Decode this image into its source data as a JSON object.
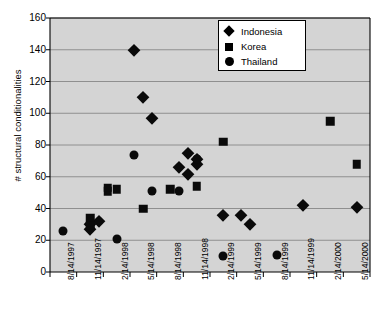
{
  "chart_data": {
    "type": "scatter",
    "title": "",
    "xlabel": "",
    "ylabel": "# structural conditionalities",
    "ylim": [
      0,
      160
    ],
    "yticks": [
      0,
      20,
      40,
      60,
      80,
      100,
      120,
      140,
      160
    ],
    "grid": true,
    "legend_position": "top-right",
    "plot_background": "#d4d4d4",
    "marker_color": "#000000",
    "x_categories": [
      "8/14/1997",
      "11/14/1997",
      "2/14/1998",
      "5/14/1998",
      "8/14/1998",
      "11/14/1998",
      "2/14/1999",
      "5/14/1999",
      "8/14/1999",
      "11/14/1999",
      "2/14/2000",
      "5/14/2000"
    ],
    "series": [
      {
        "name": "Indonesia",
        "marker": "diamond",
        "points": [
          {
            "x": "11/14/1997",
            "y": 30
          },
          {
            "x": "11/14/1997",
            "y": 27
          },
          {
            "x": "12/14/1997",
            "y": 32
          },
          {
            "x": "4/14/1998",
            "y": 140
          },
          {
            "x": "5/14/1998",
            "y": 110
          },
          {
            "x": "6/14/1998",
            "y": 97
          },
          {
            "x": "9/14/1998",
            "y": 66
          },
          {
            "x": "10/14/1998",
            "y": 62
          },
          {
            "x": "10/14/1998",
            "y": 75
          },
          {
            "x": "11/14/1998",
            "y": 71
          },
          {
            "x": "11/14/1998",
            "y": 68
          },
          {
            "x": "2/14/1999",
            "y": 36
          },
          {
            "x": "4/14/1999",
            "y": 36
          },
          {
            "x": "5/14/1999",
            "y": 30
          },
          {
            "x": "11/14/1999",
            "y": 42
          },
          {
            "x": "5/14/2000",
            "y": 41
          }
        ]
      },
      {
        "name": "Korea",
        "marker": "square",
        "points": [
          {
            "x": "11/14/1997",
            "y": 34
          },
          {
            "x": "11/14/1997",
            "y": 29
          },
          {
            "x": "1/14/1998",
            "y": 51
          },
          {
            "x": "1/14/1998",
            "y": 53
          },
          {
            "x": "2/14/1998",
            "y": 52
          },
          {
            "x": "5/14/1998",
            "y": 40
          },
          {
            "x": "8/14/1998",
            "y": 52
          },
          {
            "x": "11/14/1998",
            "y": 54
          },
          {
            "x": "2/14/1999",
            "y": 82
          },
          {
            "x": "2/14/2000",
            "y": 95
          },
          {
            "x": "5/14/2000",
            "y": 68
          }
        ]
      },
      {
        "name": "Thailand",
        "marker": "circle",
        "points": [
          {
            "x": "8/14/1997",
            "y": 26
          },
          {
            "x": "2/14/1998",
            "y": 21
          },
          {
            "x": "4/14/1998",
            "y": 74
          },
          {
            "x": "6/14/1998",
            "y": 51
          },
          {
            "x": "9/14/1998",
            "y": 51
          },
          {
            "x": "11/14/1998",
            "y": 71
          },
          {
            "x": "2/14/1999",
            "y": 10
          },
          {
            "x": "8/14/1999",
            "y": 11
          }
        ]
      }
    ]
  },
  "legend": {
    "items": [
      {
        "label": "Indonesia",
        "marker": "diamond"
      },
      {
        "label": "Korea",
        "marker": "square"
      },
      {
        "label": "Thailand",
        "marker": "circle"
      }
    ]
  }
}
